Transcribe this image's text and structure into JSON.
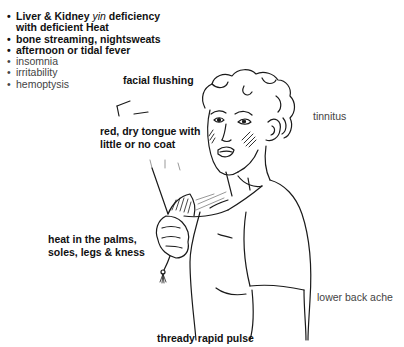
{
  "symptom_list": {
    "items": [
      {
        "prefix": "Liver & Kidney ",
        "italic": "yin",
        "suffix": " deficiency",
        "style": "bold"
      },
      {
        "prefix": "with deficient Heat",
        "italic": "",
        "suffix": "",
        "style": "bold",
        "continuation": true
      },
      {
        "prefix": "bone streaming, nightsweats",
        "italic": "",
        "suffix": "",
        "style": "bold"
      },
      {
        "prefix": "afternoon or tidal fever",
        "italic": "",
        "suffix": "",
        "style": "bold"
      },
      {
        "prefix": "insomnia",
        "italic": "",
        "suffix": "",
        "style": "light"
      },
      {
        "prefix": "irritability",
        "italic": "",
        "suffix": "",
        "style": "light"
      },
      {
        "prefix": "hemoptysis",
        "italic": "",
        "suffix": "",
        "style": "light"
      }
    ]
  },
  "labels": {
    "facial_flushing": "facial flushing",
    "tinnitus": "tinnitus",
    "tongue_line1": "red, dry tongue with",
    "tongue_line2": "little or no coat",
    "heat_line1": "heat in the palms,",
    "heat_line2": "soles, legs & kness",
    "lower_back": "lower back ache",
    "pulse": "thready rapid pulse"
  },
  "illustration": {
    "subject": "woman fanning herself with a hand fan",
    "line_color": "#1a1a1a"
  }
}
